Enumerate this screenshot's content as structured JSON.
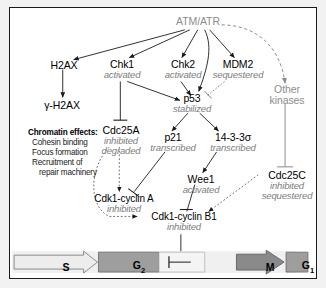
{
  "diagram": {
    "nodes": {
      "atm_atr": {
        "name": "ATM/ATR"
      },
      "h2ax": {
        "name": "H2AX"
      },
      "gamma_h2ax": {
        "name": "γ-H2AX"
      },
      "chk1": {
        "name": "Chk1",
        "state": "activated"
      },
      "chk2": {
        "name": "Chk2",
        "state": "activated"
      },
      "mdm2": {
        "name": "MDM2",
        "state": "sequestered"
      },
      "other_kinases": {
        "name_line1": "Other",
        "name_line2": "kinases"
      },
      "p53": {
        "name": "p53",
        "state": "stabilized"
      },
      "cdc25a": {
        "name": "Cdc25A",
        "state1": "inhibited",
        "state2": "degraded"
      },
      "p21": {
        "name": "p21",
        "state": "transcribed"
      },
      "s1433": {
        "name": "14-3-3σ",
        "state": "transcribed"
      },
      "wee1": {
        "name": "Wee1",
        "state": "activated"
      },
      "cdc25c": {
        "name": "Cdc25C",
        "state1": "inhibited",
        "state2": "sequestered"
      },
      "cdk1_cyclin_a": {
        "name": "Cdk1-cyclin A",
        "state": "inhibited"
      },
      "cdk1_cyclin_b1": {
        "name": "Cdk1-cyclin B1",
        "state": "inhibited"
      }
    },
    "chromatin_effects": {
      "heading": "Chromatin effects:",
      "items": [
        "Cohesin binding",
        "Focus formation",
        "Recruitment of",
        "repair machinery"
      ]
    },
    "cell_cycle": {
      "phases": [
        {
          "label": "S",
          "sub": ""
        },
        {
          "label": "G",
          "sub": "2"
        },
        {
          "label": "M",
          "sub": ""
        },
        {
          "label": "G",
          "sub": "1"
        }
      ]
    },
    "colors": {
      "node_text": "#000000",
      "state_text": "#7d7d7d",
      "gray_node": "#8c8c8c",
      "edge_black": "#1a1a1a",
      "edge_gray": "#9a9a9a",
      "phase_s": "#ededed",
      "phase_g2": "#9e9e9e",
      "phase_m": "#8a8a8a",
      "phase_g1": "#9e9e9e",
      "border": "#1a1a1a"
    }
  }
}
